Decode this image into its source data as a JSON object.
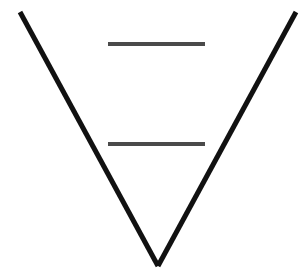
{
  "figure": {
    "name": "ponzo-illusion-figure",
    "canvas": {
      "width": 302,
      "height": 269,
      "background_color": "#ffffff"
    }
  },
  "converging_lines": {
    "stroke_color": "#111111",
    "stroke_width": 5,
    "apex": {
      "x": 158,
      "y": 266
    },
    "left_line": {
      "name": "left-converging-line",
      "x1": 20,
      "y1": 12,
      "x2": 158,
      "y2": 266
    },
    "right_line": {
      "name": "right-converging-line",
      "x1": 296,
      "y1": 12,
      "x2": 158,
      "y2": 266
    }
  },
  "bars": [
    {
      "name": "upper-test-bar",
      "label": "upper bar",
      "x1": 108,
      "x2": 205,
      "y": 44,
      "length": 97,
      "thickness": 4,
      "color": "#4a4a4a"
    },
    {
      "name": "lower-test-bar",
      "label": "lower bar",
      "x1": 108,
      "x2": 205,
      "y": 144,
      "length": 97,
      "thickness": 4,
      "color": "#4a4a4a"
    }
  ]
}
